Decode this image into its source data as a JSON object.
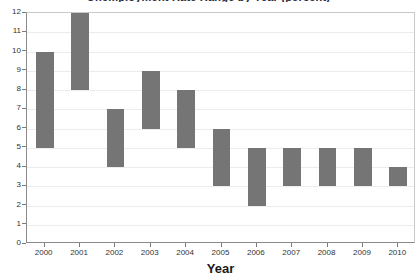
{
  "chart_data": {
    "type": "bar",
    "title": "",
    "xlabel": "Year",
    "ylabel": "",
    "categories": [
      "2000",
      "2001",
      "2002",
      "2003",
      "2004",
      "2005",
      "2006",
      "2007",
      "2008",
      "2009",
      "2010"
    ],
    "bar_style": "floating-range",
    "bars": [
      {
        "category": "2000",
        "low": 5,
        "high": 10
      },
      {
        "category": "2001",
        "low": 8,
        "high": 12
      },
      {
        "category": "2002",
        "low": 4,
        "high": 7
      },
      {
        "category": "2003",
        "low": 6,
        "high": 9
      },
      {
        "category": "2004",
        "low": 5,
        "high": 8
      },
      {
        "category": "2005",
        "low": 3,
        "high": 6
      },
      {
        "category": "2006",
        "low": 2,
        "high": 5
      },
      {
        "category": "2007",
        "low": 3,
        "high": 5
      },
      {
        "category": "2008",
        "low": 3,
        "high": 5
      },
      {
        "category": "2009",
        "low": 3,
        "high": 5
      },
      {
        "category": "2010",
        "low": 3,
        "high": 4
      }
    ],
    "lows": [
      5,
      8,
      4,
      6,
      5,
      3,
      2,
      3,
      3,
      3,
      3
    ],
    "highs": [
      10,
      12,
      7,
      9,
      8,
      6,
      5,
      5,
      5,
      5,
      4
    ],
    "ylim": [
      0,
      12
    ],
    "y_ticks": [
      0,
      1,
      2,
      3,
      4,
      5,
      6,
      7,
      8,
      9,
      10,
      11,
      12
    ],
    "y_tick_labels": [
      "0",
      "1",
      "2",
      "3",
      "4",
      "5",
      "6",
      "7",
      "8",
      "9",
      "10",
      "11",
      "12"
    ],
    "grid": true,
    "grid_axis": "y",
    "legend": null,
    "bar_color": "#757575",
    "grid_color": "#ececec",
    "axis_color": "#8a8a8a"
  },
  "axes": {
    "x_title": "Year",
    "y_title": ""
  },
  "title_sliver": {
    "text": "Unemployment Rate Range by Year (percent)"
  }
}
